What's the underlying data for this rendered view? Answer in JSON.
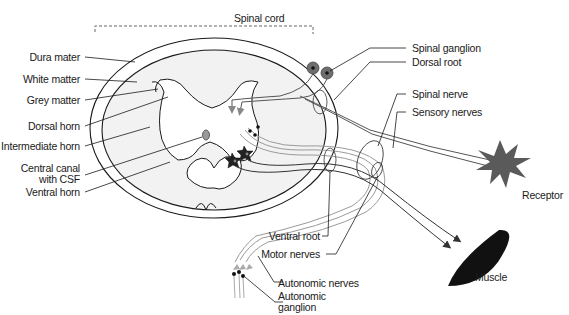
{
  "diagram": {
    "title_bracket": "Spinal cord",
    "left_labels": [
      {
        "id": "dura-mater",
        "text": "Dura mater"
      },
      {
        "id": "white-matter",
        "text": "White matter"
      },
      {
        "id": "grey-matter",
        "text": "Grey matter"
      },
      {
        "id": "dorsal-horn",
        "text": "Dorsal horn"
      },
      {
        "id": "intermediate-horn",
        "text": "Intermediate horn"
      },
      {
        "id": "central-canal-1",
        "text": "Central canal"
      },
      {
        "id": "central-canal-2",
        "text": "with CSF"
      },
      {
        "id": "ventral-horn",
        "text": "Ventral horn"
      }
    ],
    "right_labels": [
      {
        "id": "spinal-ganglion",
        "text": "Spinal ganglion"
      },
      {
        "id": "dorsal-root",
        "text": "Dorsal root"
      },
      {
        "id": "spinal-nerve",
        "text": "Spinal nerve"
      },
      {
        "id": "sensory-nerves",
        "text": "Sensory nerves"
      },
      {
        "id": "receptor",
        "text": "Receptor"
      },
      {
        "id": "muscle",
        "text": "Muscle"
      }
    ],
    "bottom_labels": [
      {
        "id": "ventral-root",
        "text": "Ventral root"
      },
      {
        "id": "motor-nerves",
        "text": "Motor nerves"
      },
      {
        "id": "autonomic-nerves",
        "text": "Autonomic nerves"
      },
      {
        "id": "autonomic-ganglion-1",
        "text": "Autonomic"
      },
      {
        "id": "autonomic-ganglion-2",
        "text": "ganglion"
      }
    ],
    "colors": {
      "outline": "#1a1a1a",
      "cord_fill": "#f2f2f2",
      "sensory_nerve": "#555555",
      "autonomic_nerve": "#9a9a9a",
      "receptor": "#5a5a5a",
      "muscle": "#111111",
      "ganglion": "#6e6e6e"
    }
  }
}
